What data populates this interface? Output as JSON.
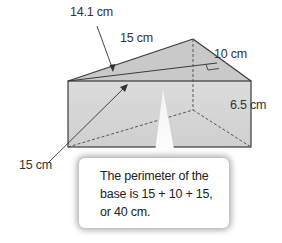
{
  "figure": {
    "type": "triangular-prism",
    "labels": {
      "slant_height": "14.1 cm",
      "top_edge": "15 cm",
      "short_edge": "10 cm",
      "height": "6.5 cm",
      "bottom_edge": "15 cm"
    },
    "colors": {
      "front_face": "#d6d6d6",
      "top_face": "#c8c8c8",
      "side_face": "#bdbdbd",
      "edge": "#3a3a3a",
      "hidden_edge": "#555555"
    }
  },
  "callout": {
    "lines": [
      "The perimeter of the",
      "base is 15 + 10 + 15,",
      "or 40 cm."
    ]
  }
}
